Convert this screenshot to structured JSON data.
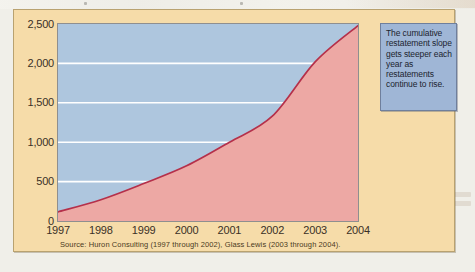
{
  "panel": {
    "background_color": "#f6dca9",
    "border_color": "#b9a270"
  },
  "callout": {
    "text": "The cumulative restatement slope gets steeper each year as restatements continue to rise.",
    "background_color": "#9fb6d6",
    "border_color": "#6f7f9c"
  },
  "source_note": "Source: Huron Consulting (1997 through 2002), Glass Lewis (2003 through 2004).",
  "chart_data": {
    "type": "area",
    "title": "",
    "subtitle": "",
    "xlabel": "",
    "ylabel": "",
    "x": [
      1997,
      1998,
      1999,
      2000,
      2001,
      2002,
      2003,
      2004
    ],
    "xtick_labels": [
      "1997",
      "1998",
      "1999",
      "2000",
      "2001",
      "2002",
      "2003",
      "2004"
    ],
    "values": [
      116,
      270,
      475,
      700,
      1000,
      1330,
      2020,
      2480
    ],
    "series": [
      {
        "name": "Cumulative restatements",
        "values": [
          116,
          270,
          475,
          700,
          1000,
          1330,
          2020,
          2480
        ]
      }
    ],
    "ylim": [
      0,
      2500
    ],
    "xlim": [
      1997,
      2004
    ],
    "yticks": [
      0,
      500,
      1000,
      1500,
      2000,
      2500
    ],
    "ytick_labels": [
      "0",
      "500",
      "1,000",
      "1,500",
      "2,000",
      "2,500"
    ],
    "grid": true,
    "gridline_color": "#ffffff",
    "legend": false,
    "legend_position": "none",
    "area_fill_color": "#eda8a4",
    "area_above_color": "#aec6de",
    "line_color": "#b5304a",
    "plot_border_color": "#8f8f8f"
  }
}
